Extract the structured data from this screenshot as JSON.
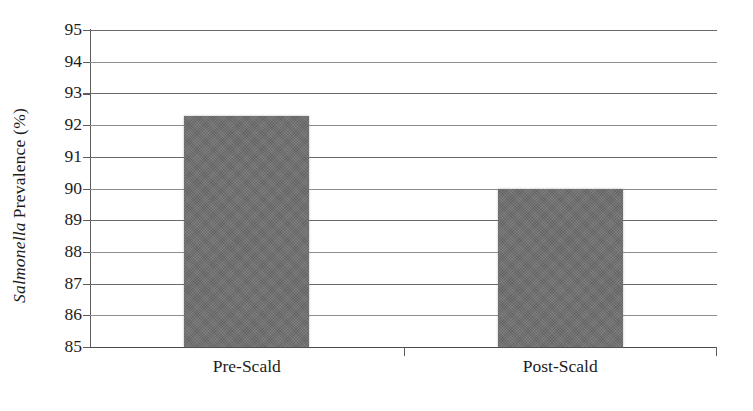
{
  "chart_data": {
    "type": "bar",
    "title": "",
    "subtitle": "",
    "xlabel": "",
    "ylabel_italic_part": "Salmonella",
    "ylabel_rest": "Prevalence (%)",
    "ylabel": "Salmonella Prevalence (%)",
    "categories": [
      "Pre-Scald",
      "Post-Scald"
    ],
    "values": [
      92.3,
      90.0
    ],
    "series": [
      {
        "name": "Salmonella Prevalence",
        "values": [
          92.3,
          90.0
        ]
      }
    ],
    "ylim": [
      85,
      95
    ],
    "ytick_values": [
      95,
      94,
      93,
      92,
      91,
      90,
      89,
      88,
      87,
      86,
      85
    ],
    "ytick_labels": [
      "95",
      "94",
      "93",
      "92",
      "91",
      "90",
      "89",
      "88",
      "87",
      "86",
      "85"
    ],
    "ytick_step": 1,
    "grid": true,
    "grid_axis": "y",
    "legend": false,
    "legend_position": "none",
    "bar_color": "#6f6f6f",
    "gridline_color": "#8d8d8d",
    "axis_color": "#5d5d5d",
    "text_color": "#1c1c1c",
    "background_color": "#ffffff",
    "annotations": []
  }
}
